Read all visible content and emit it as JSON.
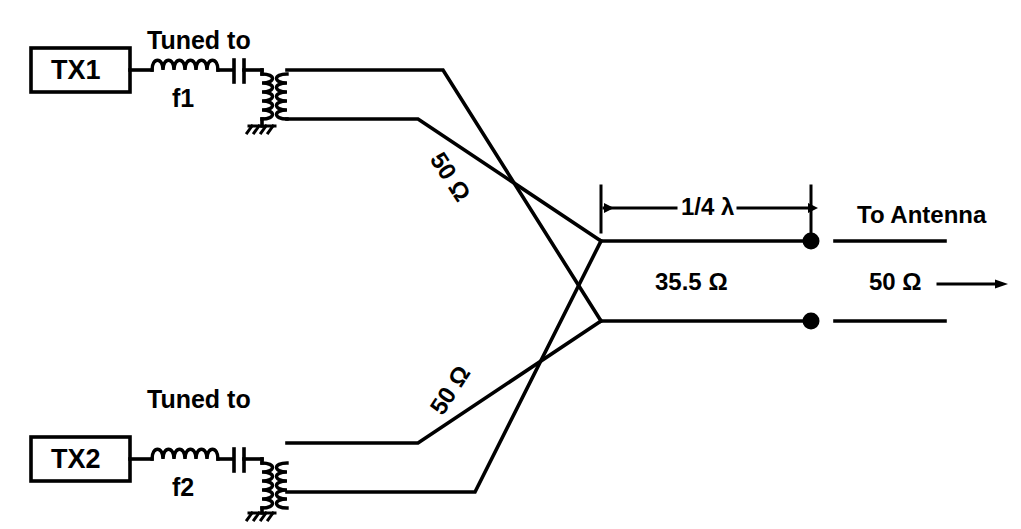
{
  "diagram": {
    "stroke_color": "#000000",
    "background_color": "#ffffff",
    "branches": [
      {
        "id": "top",
        "transmitter_label": "TX1",
        "tuned_caption": "Tuned to",
        "tuned_frequency": "f1",
        "line_impedance": "50 Ω",
        "components": [
          "inductor",
          "capacitor",
          "transformer",
          "ground"
        ]
      },
      {
        "id": "bottom",
        "transmitter_label": "TX2",
        "tuned_caption": "Tuned to",
        "tuned_frequency": "f2",
        "line_impedance": "50 Ω",
        "components": [
          "inductor",
          "capacitor",
          "transformer",
          "ground"
        ]
      }
    ],
    "matching_section": {
      "length_label": "1/4 λ",
      "impedance_label": "35.5 Ω"
    },
    "output": {
      "destination_label": "To Antenna",
      "impedance_label": "50 Ω",
      "direction": "right"
    }
  }
}
